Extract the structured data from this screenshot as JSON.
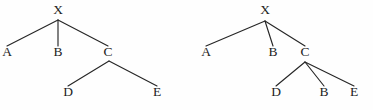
{
  "figure": {
    "background_color": "#fefefe",
    "line_color": "#262626",
    "text_color": "#1d1d1d",
    "width": 373,
    "height": 110
  },
  "trees": [
    {
      "id": "left-tree",
      "name": "tree-left",
      "root": "X",
      "nodes": [
        {
          "id": "L-X",
          "label": "X",
          "x": 58,
          "y": 14,
          "anchor_x": 58,
          "anchor_y": 20
        },
        {
          "id": "L-A",
          "label": "A",
          "x": 7,
          "y": 56,
          "anchor_x": 7,
          "anchor_y": 46
        },
        {
          "id": "L-B",
          "label": "B",
          "x": 58,
          "y": 56,
          "anchor_x": 58,
          "anchor_y": 46
        },
        {
          "id": "L-C",
          "label": "C",
          "x": 108,
          "y": 56,
          "anchor_x": 108,
          "anchor_y": 46
        },
        {
          "id": "L-D",
          "label": "D",
          "x": 68,
          "y": 96,
          "anchor_x": 68,
          "anchor_y": 86
        },
        {
          "id": "L-E",
          "label": "E",
          "x": 157,
          "y": 96,
          "anchor_x": 157,
          "anchor_y": 86
        }
      ],
      "edges": [
        {
          "id": "L-X-A",
          "from": "X",
          "to": "A",
          "x1": 58,
          "y1": 20,
          "x2": 7,
          "y2": 46
        },
        {
          "id": "L-X-B",
          "from": "X",
          "to": "B",
          "x1": 58,
          "y1": 20,
          "x2": 58,
          "y2": 46
        },
        {
          "id": "L-X-C",
          "from": "X",
          "to": "C",
          "x1": 58,
          "y1": 20,
          "x2": 108,
          "y2": 46
        },
        {
          "id": "L-C-D",
          "from": "C",
          "to": "D",
          "x1": 109,
          "y1": 61,
          "x2": 68,
          "y2": 86
        },
        {
          "id": "L-C-E",
          "from": "C",
          "to": "E",
          "x1": 109,
          "y1": 61,
          "x2": 157,
          "y2": 86
        }
      ]
    },
    {
      "id": "right-tree",
      "name": "tree-right",
      "root": "X",
      "nodes": [
        {
          "id": "R-X",
          "label": "X",
          "x": 265,
          "y": 14,
          "anchor_x": 265,
          "anchor_y": 21
        },
        {
          "id": "R-A",
          "label": "A",
          "x": 206,
          "y": 56,
          "anchor_x": 206,
          "anchor_y": 46
        },
        {
          "id": "R-B",
          "label": "B",
          "x": 273,
          "y": 56,
          "anchor_x": 273,
          "anchor_y": 46
        },
        {
          "id": "R-C",
          "label": "C",
          "x": 305,
          "y": 56,
          "anchor_x": 305,
          "anchor_y": 46
        },
        {
          "id": "R-D",
          "label": "D",
          "x": 276,
          "y": 96,
          "anchor_x": 276,
          "anchor_y": 86
        },
        {
          "id": "R-B2",
          "label": "B",
          "x": 324,
          "y": 96,
          "anchor_x": 324,
          "anchor_y": 86
        },
        {
          "id": "R-E",
          "label": "E",
          "x": 354,
          "y": 96,
          "anchor_x": 354,
          "anchor_y": 86
        }
      ],
      "edges": [
        {
          "id": "R-X-A",
          "from": "X",
          "to": "A",
          "x1": 265,
          "y1": 21,
          "x2": 206,
          "y2": 46
        },
        {
          "id": "R-X-B",
          "from": "X",
          "to": "B",
          "x1": 265,
          "y1": 21,
          "x2": 273,
          "y2": 46
        },
        {
          "id": "R-X-C",
          "from": "X",
          "to": "C",
          "x1": 265,
          "y1": 21,
          "x2": 305,
          "y2": 46
        },
        {
          "id": "R-C-D",
          "from": "C",
          "to": "D",
          "x1": 305,
          "y1": 62,
          "x2": 276,
          "y2": 86
        },
        {
          "id": "R-C-B2",
          "from": "C",
          "to": "B",
          "x1": 305,
          "y1": 62,
          "x2": 324,
          "y2": 86
        },
        {
          "id": "R-C-E",
          "from": "C",
          "to": "E",
          "x1": 305,
          "y1": 62,
          "x2": 354,
          "y2": 86
        }
      ]
    }
  ]
}
